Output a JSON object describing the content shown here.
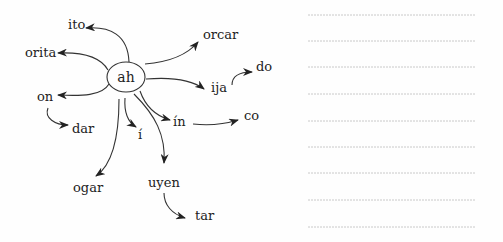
{
  "hub": {
    "label": "ah"
  },
  "words": {
    "ito": "ito",
    "orita": "orita",
    "on": "on",
    "dar": "dar",
    "orcar": "orcar",
    "ija": "ija",
    "do": "do",
    "in": "ín",
    "co": "co",
    "i": "í",
    "ogar": "ogar",
    "uyen": "uyen",
    "tar": "tar"
  },
  "writing_lines": {
    "count": 9
  },
  "colors": {
    "ink": "#222222",
    "line": "#bdbdbd",
    "background": "#fefefe"
  }
}
